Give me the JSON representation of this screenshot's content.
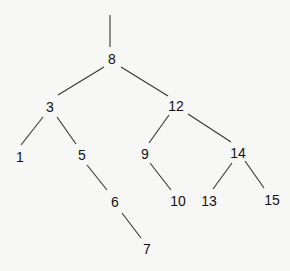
{
  "diagram": {
    "type": "binary-search-tree",
    "root_edge": {
      "x1": 110,
      "y1": 15,
      "x2": 110,
      "y2": 47
    },
    "nodes": [
      {
        "id": "n8",
        "label": "8",
        "x": 112,
        "y": 59
      },
      {
        "id": "n3",
        "label": "3",
        "x": 50,
        "y": 107
      },
      {
        "id": "n12",
        "label": "12",
        "x": 176,
        "y": 106
      },
      {
        "id": "n1",
        "label": "1",
        "x": 20,
        "y": 157
      },
      {
        "id": "n5",
        "label": "5",
        "x": 82,
        "y": 155
      },
      {
        "id": "n9",
        "label": "9",
        "x": 145,
        "y": 154
      },
      {
        "id": "n14",
        "label": "14",
        "x": 238,
        "y": 153
      },
      {
        "id": "n6",
        "label": "6",
        "x": 115,
        "y": 202
      },
      {
        "id": "n10",
        "label": "10",
        "x": 178,
        "y": 201
      },
      {
        "id": "n13",
        "label": "13",
        "x": 209,
        "y": 201
      },
      {
        "id": "n15",
        "label": "15",
        "x": 272,
        "y": 200
      },
      {
        "id": "n7",
        "label": "7",
        "x": 147,
        "y": 249
      }
    ],
    "edges": [
      {
        "from": "8",
        "to": "3",
        "x1": 104,
        "y1": 67,
        "x2": 58,
        "y2": 95
      },
      {
        "from": "8",
        "to": "12",
        "x1": 121,
        "y1": 67,
        "x2": 168,
        "y2": 96
      },
      {
        "from": "3",
        "to": "1",
        "x1": 43,
        "y1": 117,
        "x2": 21,
        "y2": 145
      },
      {
        "from": "3",
        "to": "5",
        "x1": 57,
        "y1": 117,
        "x2": 76,
        "y2": 144
      },
      {
        "from": "12",
        "to": "9",
        "x1": 169,
        "y1": 115,
        "x2": 149,
        "y2": 143
      },
      {
        "from": "12",
        "to": "14",
        "x1": 188,
        "y1": 114,
        "x2": 231,
        "y2": 142
      },
      {
        "from": "5",
        "to": "6",
        "x1": 87,
        "y1": 165,
        "x2": 107,
        "y2": 190
      },
      {
        "from": "9",
        "to": "10",
        "x1": 150,
        "y1": 163,
        "x2": 171,
        "y2": 190
      },
      {
        "from": "14",
        "to": "13",
        "x1": 232,
        "y1": 163,
        "x2": 213,
        "y2": 189
      },
      {
        "from": "14",
        "to": "15",
        "x1": 245,
        "y1": 161,
        "x2": 264,
        "y2": 188
      },
      {
        "from": "6",
        "to": "7",
        "x1": 122,
        "y1": 213,
        "x2": 141,
        "y2": 238
      }
    ]
  }
}
